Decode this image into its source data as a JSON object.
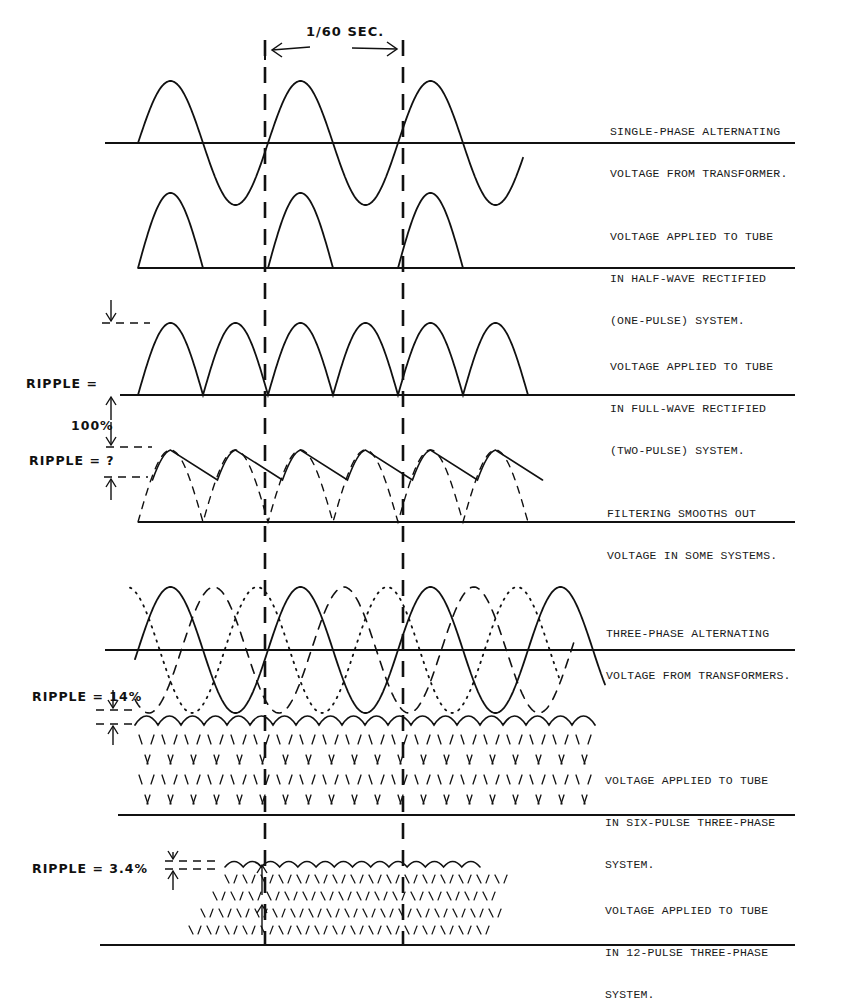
{
  "figure": {
    "period_label": "1/60 SEC.",
    "panels": [
      {
        "id": "single-phase",
        "caption": [
          "SINGLE-PHASE ALTERNATING",
          "VOLTAGE FROM TRANSFORMER."
        ]
      },
      {
        "id": "half-wave",
        "caption": [
          "VOLTAGE APPLIED TO TUBE",
          "IN HALF-WAVE RECTIFIED",
          "(ONE-PULSE) SYSTEM."
        ]
      },
      {
        "id": "full-wave",
        "caption": [
          "VOLTAGE APPLIED TO TUBE",
          "IN FULL-WAVE RECTIFIED",
          "(TWO-PULSE) SYSTEM."
        ],
        "ripple_label": [
          "RIPPLE =",
          "100%"
        ]
      },
      {
        "id": "filtered",
        "caption": [
          "FILTERING SMOOTHS OUT",
          "VOLTAGE IN SOME SYSTEMS."
        ],
        "ripple_label": [
          "RIPPLE = ?"
        ]
      },
      {
        "id": "three-phase",
        "caption": [
          "THREE-PHASE ALTERNATING",
          "VOLTAGE FROM TRANSFORMERS."
        ]
      },
      {
        "id": "six-pulse",
        "caption": [
          "VOLTAGE APPLIED TO TUBE",
          "IN SIX-PULSE THREE-PHASE",
          "SYSTEM."
        ],
        "ripple_label": [
          "RIPPLE = 14%"
        ]
      },
      {
        "id": "twelve-pulse",
        "caption": [
          "VOLTAGE APPLIED TO TUBE",
          "IN 12-PULSE THREE-PHASE",
          "SYSTEM."
        ],
        "ripple_label": [
          "RIPPLE = 3.4%"
        ]
      }
    ]
  }
}
